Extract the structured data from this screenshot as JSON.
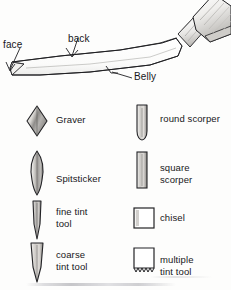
{
  "figure": {
    "diagram": {
      "tool_name": "graver",
      "handle": "mushroom-wood-handle",
      "callouts": [
        {
          "id": "face",
          "label": "face"
        },
        {
          "id": "back",
          "label": "back"
        },
        {
          "id": "belly",
          "label": "Belly"
        }
      ]
    },
    "legend": {
      "left_column": [
        {
          "id": "graver",
          "label_lines": [
            "Graver"
          ],
          "glyph": "diamond-lozenge-profile-icon"
        },
        {
          "id": "spitsticker",
          "label_lines": [
            "Spitsticker"
          ],
          "glyph": "lancet-teardrop-profile-icon"
        },
        {
          "id": "fine-tint-tool",
          "label_lines": [
            "fine tint",
            "tool"
          ],
          "glyph": "narrow-tapered-blade-profile-icon"
        },
        {
          "id": "coarse-tint-tool",
          "label_lines": [
            "coarse",
            "tint tool"
          ],
          "glyph": "wide-tapered-blade-profile-icon"
        }
      ],
      "right_column": [
        {
          "id": "round-scorper",
          "label_lines": [
            "round  scorper"
          ],
          "glyph": "round-bottom-rectangle-profile-icon"
        },
        {
          "id": "square-scorper",
          "label_lines": [
            "square",
            "scorper"
          ],
          "glyph": "narrow-rectangle-profile-icon"
        },
        {
          "id": "chisel",
          "label_lines": [
            "chisel"
          ],
          "glyph": "square-profile-icon"
        },
        {
          "id": "multiple-tint-tool",
          "label_lines": [
            "multiple",
            "tint tool"
          ],
          "glyph": "serrated-bottom-square-profile-icon"
        }
      ]
    },
    "colors": {
      "ink": "#17171a",
      "line": "#2a2a2e",
      "paper": "#fdfdfc",
      "shade_light": "#d8d6d2",
      "shade_mid": "#a9a7a4",
      "shade_dark": "#6e6c6a"
    }
  }
}
